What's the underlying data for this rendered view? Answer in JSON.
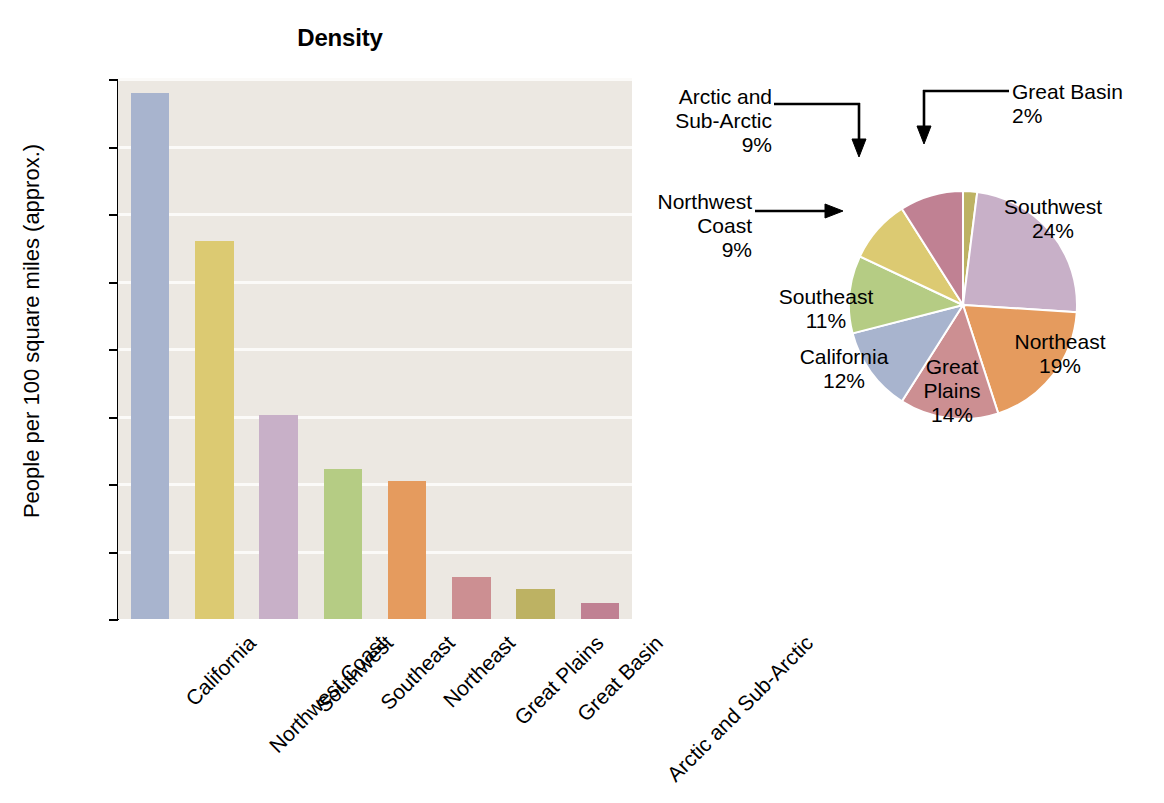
{
  "figure": {
    "caption": "FIGURE 1.1 Native American Population in North America about 1492 (Estimated)"
  },
  "bar_panel": {
    "title": "Density",
    "y_axis_title": "People per 100 square miles (approx.)"
  },
  "pie_panel": {
    "title": "Location"
  },
  "chart_data": [
    {
      "type": "bar",
      "title": "Density",
      "xlabel": "",
      "ylabel": "People per 100 square miles (approx.)",
      "ylim": [
        0,
        400
      ],
      "yticks": [
        0,
        50,
        100,
        150,
        200,
        250,
        300,
        350,
        400
      ],
      "grid": true,
      "legend": "none",
      "categories": [
        "California",
        "Northwest Coast",
        "Southwest",
        "Southeast",
        "Northeast",
        "Great Plains",
        "Great Basin",
        "Arctic and Sub-Arctic"
      ],
      "values": [
        390,
        280,
        151,
        111,
        102,
        31,
        22,
        12
      ],
      "colors": [
        "#a8b4ce",
        "#dcca72",
        "#c8b0c8",
        "#b5cc84",
        "#e59b5e",
        "#cc8f92",
        "#bdb263",
        "#c08193"
      ]
    },
    {
      "type": "pie",
      "title": "Location",
      "start_angle_deg": 0,
      "direction": "clockwise",
      "slices": [
        {
          "label": "Great Basin",
          "value": 2,
          "display": "2%",
          "color": "#bdb263",
          "label_placement": "callout"
        },
        {
          "label": "Southwest",
          "value": 24,
          "display": "24%",
          "color": "#c8b0c8",
          "label_placement": "inside"
        },
        {
          "label": "Northeast",
          "value": 19,
          "display": "19%",
          "color": "#e59b5e",
          "label_placement": "inside"
        },
        {
          "label": "Great Plains",
          "value": 14,
          "display": "14%",
          "color": "#cc8f92",
          "label_placement": "inside"
        },
        {
          "label": "California",
          "value": 12,
          "display": "12%",
          "color": "#a8b4ce",
          "label_placement": "inside"
        },
        {
          "label": "Southeast",
          "value": 11,
          "display": "11%",
          "color": "#b5cc84",
          "label_placement": "inside"
        },
        {
          "label": "Northwest Coast",
          "value": 9,
          "display": "9%",
          "color": "#dcca72",
          "label_placement": "callout"
        },
        {
          "label": "Arctic and Sub-Arctic",
          "value": 9,
          "display": "9%",
          "color": "#c08193",
          "label_placement": "callout"
        }
      ]
    }
  ],
  "pie_labels": {
    "great_basin": {
      "line1": "Great Basin",
      "line2": "2%"
    },
    "arctic": {
      "line1": "Arctic and",
      "line2": "Sub-Arctic",
      "line3": "9%"
    },
    "northwest": {
      "line1": "Northwest",
      "line2": "Coast",
      "line3": "9%"
    },
    "southeast": {
      "line1": "Southeast",
      "line2": "11%"
    },
    "california": {
      "line1": "California",
      "line2": "12%"
    },
    "great_plains": {
      "line1": "Great",
      "line2": "Plains",
      "line3": "14%"
    },
    "northeast": {
      "line1": "Northeast",
      "line2": "19%"
    },
    "southwest": {
      "line1": "Southwest",
      "line2": "24%"
    }
  }
}
